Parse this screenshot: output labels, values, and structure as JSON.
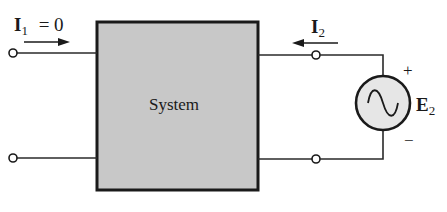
{
  "diagram": {
    "type": "two-port network",
    "system_block": {
      "label": "System",
      "fill": "#c8c8c8",
      "stroke": "#1a1a1a"
    },
    "input_port": {
      "current_label": "I",
      "current_subscript": "1",
      "current_equation": "= 0",
      "current_direction": "right"
    },
    "output_port": {
      "current_label": "I",
      "current_subscript": "2",
      "current_direction": "left"
    },
    "source": {
      "type": "ac-voltage-source",
      "label": "E",
      "subscript": "2",
      "positive": "+",
      "negative": "−",
      "fill": "#e6e6e6"
    }
  }
}
